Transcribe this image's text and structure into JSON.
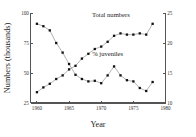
{
  "chart_data": {
    "type": "line",
    "title": "",
    "xlabel": "Year",
    "ylabel": "Numbers (thousands)",
    "ylabel_right": "",
    "xlim": [
      1959,
      1980
    ],
    "ylim": [
      25,
      100
    ],
    "ylim_right": [
      10,
      25
    ],
    "grid": false,
    "legend_position": "inline-annotation",
    "x_ticks": [
      "1960",
      "1965",
      "1970",
      "1975",
      "1980"
    ],
    "x_tick_values": [
      1960,
      1965,
      1970,
      1975,
      1980
    ],
    "y_ticks_left": [
      "25",
      "50",
      "75",
      "100"
    ],
    "y_tick_values_left": [
      25,
      50,
      75,
      100
    ],
    "y_ticks_right": [
      "10",
      "15",
      "20",
      "25"
    ],
    "y_tick_values_right": [
      10,
      15,
      20,
      25
    ],
    "series": [
      {
        "name": "Total numbers",
        "axis": "left",
        "marker": "square",
        "x": [
          1960,
          1961,
          1962,
          1963,
          1964,
          1965,
          1966,
          1967,
          1968,
          1969,
          1970,
          1971,
          1972,
          1973,
          1974,
          1975,
          1976,
          1977,
          1978
        ],
        "values": [
          34,
          38,
          41,
          45,
          48,
          53,
          56,
          62,
          66,
          70,
          72,
          76,
          81,
          83,
          82,
          82,
          83,
          82,
          91
        ]
      },
      {
        "name": "% juveniles",
        "axis": "right",
        "marker": "square",
        "x": [
          1960,
          1961,
          1962,
          1963,
          1964,
          1965,
          1966,
          1967,
          1968,
          1969,
          1970,
          1971,
          1972,
          1973,
          1974,
          1975,
          1976,
          1977,
          1978
        ],
        "values": [
          23.2,
          22.8,
          22.1,
          20.0,
          18.4,
          16.5,
          14.7,
          14.0,
          13.6,
          13.7,
          13.3,
          14.6,
          16.1,
          14.6,
          13.8,
          13.6,
          12.5,
          12.0,
          13.5
        ]
      }
    ],
    "annotations": [
      {
        "text": "Total numbers",
        "x": 1971.5,
        "y_axis": "left",
        "y": 97
      },
      {
        "text": "% juveniles",
        "x": 1971.0,
        "y_axis": "right",
        "y": 17.9
      }
    ]
  },
  "colors": {
    "axis": "#555555",
    "line": "#8a8a8a",
    "marker": "#111111",
    "text": "#222222",
    "background": "#ffffff"
  }
}
